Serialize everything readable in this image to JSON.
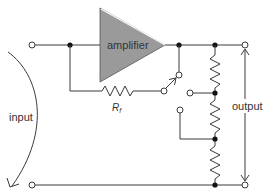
{
  "diagram": {
    "labels": {
      "amplifier": "amplifier",
      "input": "input",
      "output": "output",
      "feedback_resistor": "R",
      "feedback_resistor_subscript": "f"
    },
    "colors": {
      "amplifier_fill": "#9a9a9a",
      "amplifier_edge": "#555555",
      "wire": "#3a3a3a",
      "node": "#111111",
      "background": "#ffffff"
    },
    "components": [
      {
        "id": "amplifier",
        "type": "amplifier-triangle",
        "label": "amplifier"
      },
      {
        "id": "rf",
        "type": "resistor",
        "label": "Rf"
      },
      {
        "id": "switch",
        "type": "selector-switch",
        "positions": 3
      },
      {
        "id": "r-top",
        "type": "resistor"
      },
      {
        "id": "r-mid",
        "type": "resistor"
      },
      {
        "id": "r-bottom",
        "type": "resistor"
      }
    ],
    "terminals": [
      "input-top",
      "input-bottom",
      "output-top",
      "output-bottom"
    ]
  }
}
